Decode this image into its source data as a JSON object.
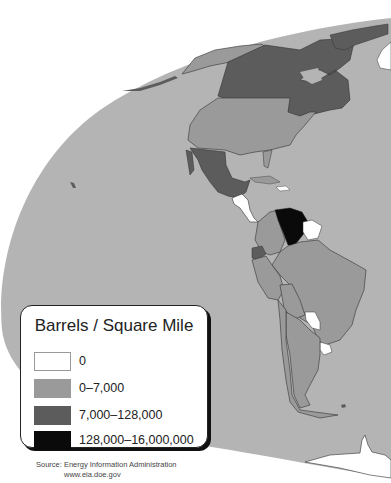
{
  "map": {
    "title": "Barrels / Square Mile",
    "region": "Americas",
    "colors": {
      "background": "#ffffff",
      "ocean": "#b4b4b4",
      "none": "#ffffff",
      "low": "#9a9a9a",
      "mid": "#5c5c5c",
      "high": "#0a0a0a"
    },
    "countries": [
      {
        "name": "Alaska (USA)",
        "class": "0-7,000"
      },
      {
        "name": "Canada",
        "class": "7,000-128,000"
      },
      {
        "name": "United States",
        "class": "0-7,000"
      },
      {
        "name": "Mexico",
        "class": "7,000-128,000"
      },
      {
        "name": "Central America",
        "class": "0"
      },
      {
        "name": "Venezuela",
        "class": "128,000-16,000,000"
      },
      {
        "name": "Guyana/Suriname/French Guiana",
        "class": "0"
      },
      {
        "name": "Colombia",
        "class": "0-7,000"
      },
      {
        "name": "Ecuador",
        "class": "7,000-128,000"
      },
      {
        "name": "Brazil",
        "class": "0-7,000"
      },
      {
        "name": "Peru",
        "class": "0-7,000"
      },
      {
        "name": "Bolivia",
        "class": "0-7,000"
      },
      {
        "name": "Paraguay",
        "class": "0"
      },
      {
        "name": "Uruguay",
        "class": "0"
      },
      {
        "name": "Argentina",
        "class": "0-7,000"
      },
      {
        "name": "Chile",
        "class": "0-7,000"
      },
      {
        "name": "Greenland",
        "class": "0"
      },
      {
        "name": "Antarctica",
        "class": "0"
      }
    ]
  },
  "legend": {
    "title": "Barrels / Square Mile",
    "items": [
      {
        "label": "0",
        "color": "#ffffff"
      },
      {
        "label": "0–7,000",
        "color": "#9a9a9a"
      },
      {
        "label": "7,000–128,000",
        "color": "#5c5c5c"
      },
      {
        "label": "128,000–16,000,000",
        "color": "#0a0a0a"
      }
    ]
  },
  "source": {
    "line1": "Source: Energy Information Administration",
    "line2": "www.eia.doe.gov"
  }
}
